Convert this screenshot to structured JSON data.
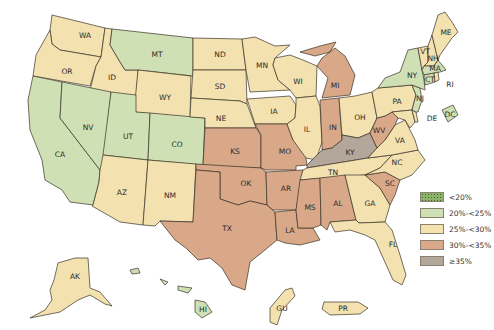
{
  "map": {
    "type": "choropleth",
    "region": "United States and territories",
    "legend": [
      {
        "id": "lt20",
        "label": "<20%",
        "color": "#8fb26a"
      },
      {
        "id": "20to25",
        "label": "20%-<25%",
        "color": "#cfe0b4"
      },
      {
        "id": "25to30",
        "label": "25%-<30%",
        "color": "#f3e2b0"
      },
      {
        "id": "30to35",
        "label": "30%-<35%",
        "color": "#d9a888"
      },
      {
        "id": "ge35",
        "label": "≥35%",
        "color": "#b3a69a"
      }
    ],
    "states": [
      {
        "abbr": "WA",
        "class": "25to30"
      },
      {
        "abbr": "OR",
        "class": "25to30"
      },
      {
        "abbr": "CA",
        "class": "20to25"
      },
      {
        "abbr": "ID",
        "class": "25to30"
      },
      {
        "abbr": "NV",
        "class": "20to25"
      },
      {
        "abbr": "MT",
        "class": "20to25"
      },
      {
        "abbr": "WY",
        "class": "25to30"
      },
      {
        "abbr": "UT",
        "class": "20to25"
      },
      {
        "abbr": "AZ",
        "class": "25to30"
      },
      {
        "abbr": "CO",
        "class": "20to25"
      },
      {
        "abbr": "NM",
        "class": "25to30"
      },
      {
        "abbr": "ND",
        "class": "25to30"
      },
      {
        "abbr": "SD",
        "class": "25to30"
      },
      {
        "abbr": "NE",
        "class": "25to30"
      },
      {
        "abbr": "KS",
        "class": "30to35"
      },
      {
        "abbr": "OK",
        "class": "30to35"
      },
      {
        "abbr": "TX",
        "class": "30to35"
      },
      {
        "abbr": "MN",
        "class": "25to30"
      },
      {
        "abbr": "IA",
        "class": "25to30"
      },
      {
        "abbr": "MO",
        "class": "30to35"
      },
      {
        "abbr": "AR",
        "class": "30to35"
      },
      {
        "abbr": "LA",
        "class": "30to35"
      },
      {
        "abbr": "WI",
        "class": "25to30"
      },
      {
        "abbr": "IL",
        "class": "25to30"
      },
      {
        "abbr": "MI",
        "class": "30to35"
      },
      {
        "abbr": "IN",
        "class": "30to35"
      },
      {
        "abbr": "OH",
        "class": "25to30"
      },
      {
        "abbr": "KY",
        "class": "ge35"
      },
      {
        "abbr": "TN",
        "class": "25to30"
      },
      {
        "abbr": "MS",
        "class": "30to35"
      },
      {
        "abbr": "AL",
        "class": "30to35"
      },
      {
        "abbr": "GA",
        "class": "25to30"
      },
      {
        "abbr": "FL",
        "class": "25to30"
      },
      {
        "abbr": "SC",
        "class": "30to35"
      },
      {
        "abbr": "NC",
        "class": "25to30"
      },
      {
        "abbr": "VA",
        "class": "25to30"
      },
      {
        "abbr": "WV",
        "class": "30to35"
      },
      {
        "abbr": "PA",
        "class": "25to30"
      },
      {
        "abbr": "NY",
        "class": "20to25"
      },
      {
        "abbr": "VT",
        "class": "25to30"
      },
      {
        "abbr": "NH",
        "class": "25to30"
      },
      {
        "abbr": "ME",
        "class": "25to30"
      },
      {
        "abbr": "MA",
        "class": "20to25"
      },
      {
        "abbr": "CT",
        "class": "20to25"
      },
      {
        "abbr": "RI",
        "class": "25to30"
      },
      {
        "abbr": "NJ",
        "class": "20to25"
      },
      {
        "abbr": "DE",
        "class": "25to30"
      },
      {
        "abbr": "MD",
        "class": "25to30"
      },
      {
        "abbr": "DC",
        "class": "20to25"
      },
      {
        "abbr": "AK",
        "class": "25to30"
      },
      {
        "abbr": "HI",
        "class": "20to25"
      },
      {
        "abbr": "GU",
        "class": "25to30"
      },
      {
        "abbr": "PR",
        "class": "25to30"
      }
    ]
  }
}
